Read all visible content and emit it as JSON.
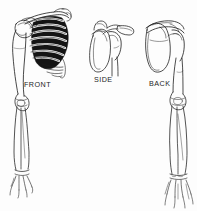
{
  "figure": {
    "background_color": "#fdfdfd",
    "ink_color": "#1a1a1a",
    "shadow_color": "#111111",
    "width": 197,
    "height": 211
  },
  "views": [
    {
      "id": "front",
      "label": "FRONT",
      "label_x": 24,
      "label_y": 80,
      "parts": [
        "clavicle",
        "scapula",
        "rib-cage",
        "sternum",
        "humerus",
        "elbow",
        "radius",
        "ulna",
        "hand"
      ]
    },
    {
      "id": "side",
      "label": "SIDE",
      "label_x": 94,
      "label_y": 75,
      "parts": [
        "clavicle",
        "acromion",
        "coracoid-process",
        "scapula-lateral",
        "glenoid",
        "humerus-head",
        "humerus-shaft"
      ]
    },
    {
      "id": "back",
      "label": "BACK",
      "label_x": 149,
      "label_y": 79,
      "parts": [
        "scapula-posterior",
        "scapular-spine",
        "acromion",
        "humerus",
        "elbow",
        "radius",
        "ulna",
        "hand"
      ]
    }
  ]
}
